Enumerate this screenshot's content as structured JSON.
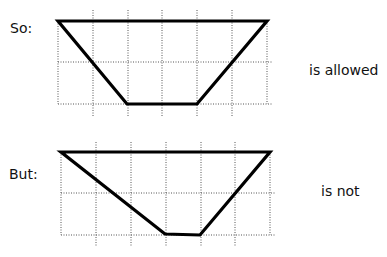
{
  "diagrams": [
    {
      "prefix": "So:",
      "verdict": "is allowed",
      "grid": {
        "x": [
          58,
          93,
          128,
          162,
          197,
          232,
          267
        ],
        "y": [
          62,
          104
        ],
        "top": 21,
        "vExtentTop": 10,
        "vExtentBottom": 116,
        "hLeft": 58,
        "hRight": 272
      },
      "shape": [
        [
          58,
          21
        ],
        [
          267,
          21
        ],
        [
          197,
          104
        ],
        [
          127,
          104
        ]
      ]
    },
    {
      "prefix": "But:",
      "verdict": "is not",
      "grid": {
        "x": [
          61,
          96,
          131,
          166,
          201,
          235,
          270
        ],
        "y": [
          193,
          235
        ],
        "top": 152,
        "vExtentTop": 142,
        "vExtentBottom": 246,
        "hLeft": 61,
        "hRight": 275
      },
      "shape": [
        [
          61,
          152
        ],
        [
          270,
          152
        ],
        [
          200,
          235
        ],
        [
          165,
          234
        ]
      ]
    }
  ],
  "colors": {
    "stroke": "#000000",
    "grid": "#555555",
    "text": "#111111"
  }
}
